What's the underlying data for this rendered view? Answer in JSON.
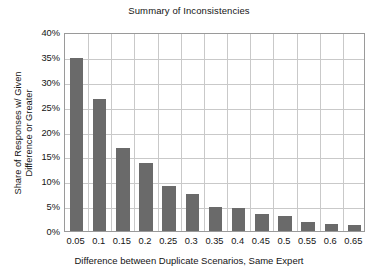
{
  "chart_data": {
    "type": "bar",
    "title": "Summary of Inconsistencies",
    "xlabel": "Difference between Duplicate Scenarios, Same Expert",
    "ylabel": "Share of Responses w/ Given Difference or Greater",
    "ylabel_lines": [
      "Share of Responses w/ Given",
      "Difference or Greater"
    ],
    "categories": [
      "0.05",
      "0.1",
      "0.15",
      "0.2",
      "0.25",
      "0.3",
      "0.35",
      "0.4",
      "0.45",
      "0.5",
      "0.55",
      "0.6",
      "0.65"
    ],
    "values": [
      34.7,
      26.6,
      16.7,
      13.7,
      9.1,
      7.4,
      4.9,
      4.7,
      3.5,
      3.0,
      1.9,
      1.5,
      1.3
    ],
    "value_labels": [
      "34.7%",
      "26.6%",
      "16.7%",
      "13.7%",
      "9.1%",
      "7.4%",
      "4.9%",
      "4.7%",
      "3.5%",
      "3.0%",
      "1.9%",
      "1.5%",
      "1.3%"
    ],
    "ylim": [
      0,
      40
    ],
    "ytick_values": [
      0,
      5,
      10,
      15,
      20,
      25,
      30,
      35,
      40
    ],
    "ytick_labels": [
      "0%",
      "5%",
      "10%",
      "15%",
      "20%",
      "25%",
      "30%",
      "35%",
      "40%"
    ],
    "grid": true,
    "legend": null,
    "bar_color": "#6a6a6a",
    "grid_color": "#c9c9c9",
    "frame_color": "#9a9a9a",
    "text_color": "#141414",
    "background": "#ffffff"
  }
}
